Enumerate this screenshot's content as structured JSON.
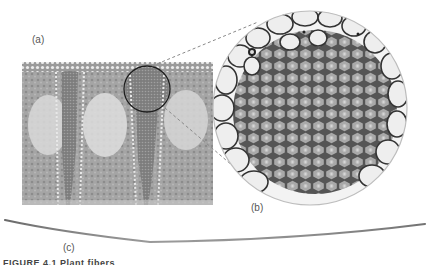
{
  "figure": {
    "labels": {
      "a": "(a)",
      "b": "(b)",
      "c": "(c)"
    },
    "caption_fragment": "FIGURE 4.1   Plant fibers",
    "panels": [
      {
        "id": "a",
        "description": "cross-section micrograph of leaf tissue with vascular fiber bundles"
      },
      {
        "id": "b",
        "description": "magnified circular view of fiber bundle cells"
      },
      {
        "id": "c",
        "description": "single elongated fiber"
      }
    ],
    "colors": {
      "background": "#ffffff",
      "tissue": "#9a9a9a",
      "cell_wall": "#3a3a3a",
      "cell_fill": "#a8a8a8",
      "large_cell_fill": "#eeeeee",
      "callout_line": "#8a8a8a"
    }
  }
}
